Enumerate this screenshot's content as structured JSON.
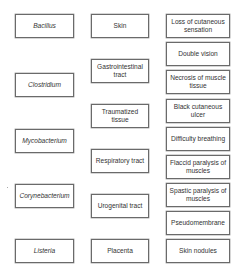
{
  "diagram": {
    "type": "matching-columns",
    "columns": {
      "organisms": [
        {
          "label": "Bacillus",
          "x": 15,
          "y": 14,
          "w": 59,
          "h": 24
        },
        {
          "label": "Clostridium",
          "x": 15,
          "y": 73,
          "w": 59,
          "h": 24
        },
        {
          "label": "Mycobacterium",
          "x": 15,
          "y": 129,
          "w": 59,
          "h": 24
        },
        {
          "label": "Corynebacterium",
          "x": 15,
          "y": 184,
          "w": 59,
          "h": 24
        },
        {
          "label": "Listeria",
          "x": 15,
          "y": 239,
          "w": 59,
          "h": 24
        }
      ],
      "entry_sites": [
        {
          "label": "Skin",
          "x": 91,
          "y": 14,
          "w": 58,
          "h": 24
        },
        {
          "label": "Gastrointestinal tract",
          "x": 91,
          "y": 59,
          "w": 58,
          "h": 24
        },
        {
          "label": "Traumatized tissue",
          "x": 91,
          "y": 104,
          "w": 58,
          "h": 24
        },
        {
          "label": "Respiratory tract",
          "x": 91,
          "y": 149,
          "w": 58,
          "h": 24
        },
        {
          "label": "Urogenital tract",
          "x": 91,
          "y": 194,
          "w": 58,
          "h": 24
        },
        {
          "label": "Placenta",
          "x": 91,
          "y": 239,
          "w": 58,
          "h": 24
        }
      ],
      "symptoms": [
        {
          "label": "Loss of cutaneous sensation",
          "x": 166,
          "y": 14,
          "w": 64,
          "h": 24
        },
        {
          "label": "Double vision",
          "x": 166,
          "y": 42,
          "w": 64,
          "h": 24
        },
        {
          "label": "Necrosis of muscle tissue",
          "x": 166,
          "y": 70,
          "w": 64,
          "h": 24
        },
        {
          "label": "Black cutaneous ulcer",
          "x": 166,
          "y": 99,
          "w": 64,
          "h": 24
        },
        {
          "label": "Difficulty breathing",
          "x": 166,
          "y": 127,
          "w": 64,
          "h": 24
        },
        {
          "label": "Flaccid paralysis of muscles",
          "x": 166,
          "y": 155,
          "w": 64,
          "h": 24
        },
        {
          "label": "Spastic paralysis of muscles",
          "x": 166,
          "y": 183,
          "w": 64,
          "h": 24
        },
        {
          "label": "Pseudomembrane",
          "x": 166,
          "y": 211,
          "w": 64,
          "h": 24
        },
        {
          "label": "Skin nodules",
          "x": 166,
          "y": 239,
          "w": 64,
          "h": 24
        }
      ]
    },
    "colors": {
      "border": "#6a6a6a",
      "text": "#333333",
      "background": "#ffffff"
    }
  }
}
